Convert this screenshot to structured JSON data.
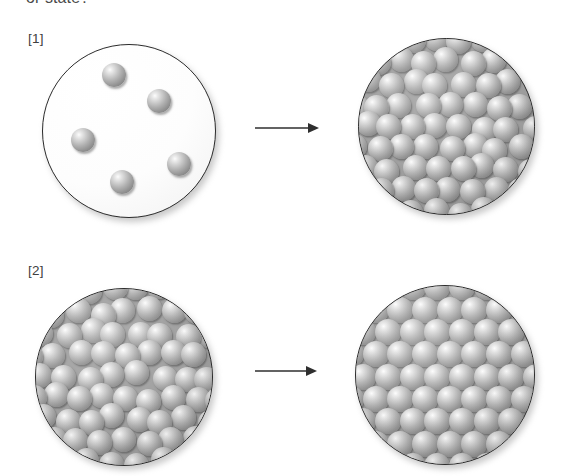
{
  "caption": {
    "top_text": "or state?"
  },
  "steps": [
    {
      "id": "1",
      "label": "[1]"
    },
    {
      "id": "2",
      "label": "[2]"
    }
  ],
  "icons": {
    "arrow": "right-arrow-icon"
  },
  "colors": {
    "sphere_base": "#949494",
    "sphere_highlight": "#fdfdfd",
    "sphere_shadow": "#6f6f6f",
    "outline": "#2b2b2b",
    "vessel_empty_fill": "#ffffff",
    "vessel_packed_fill": "#9e9e9e",
    "text": "#404040",
    "page_background": "#ffffff"
  },
  "diagram": {
    "type": "state-change-illustration",
    "rows": [
      {
        "step": "[1]",
        "before": {
          "name": "sparse-particles-vessel",
          "state": "gas",
          "arrangement": "scattered",
          "particle_count": 5,
          "vessel": {
            "x": 42,
            "y": 44,
            "size": 174
          },
          "particles": [
            {
              "x": 59,
              "y": 18,
              "r": 12
            },
            {
              "x": 104,
              "y": 44,
              "r": 12
            },
            {
              "x": 28,
              "y": 83,
              "r": 12
            },
            {
              "x": 124,
              "y": 107,
              "r": 12
            },
            {
              "x": 67,
              "y": 125,
              "r": 12
            }
          ]
        },
        "arrow": {
          "x": 255,
          "y": 121,
          "length": 62
        },
        "after": {
          "name": "dense-irregular-particles-vessel",
          "state": "liquid",
          "arrangement": "close-packed-irregular",
          "vessel": {
            "x": 358,
            "y": 38,
            "size": 177
          },
          "grid": {
            "rows": 8,
            "cols": 8,
            "radius": 12.5,
            "jitter": 3.4,
            "seed": 11
          }
        }
      },
      {
        "step": "[2]",
        "before": {
          "name": "dense-irregular-particles-vessel",
          "state": "liquid",
          "arrangement": "close-packed-irregular",
          "vessel": {
            "x": 35,
            "y": 288,
            "size": 178
          },
          "grid": {
            "rows": 8,
            "cols": 8,
            "radius": 12.5,
            "jitter": 3.6,
            "seed": 29
          }
        },
        "arrow": {
          "x": 255,
          "y": 364,
          "length": 60
        },
        "after": {
          "name": "ordered-lattice-particles-vessel",
          "state": "solid",
          "arrangement": "regular-lattice",
          "vessel": {
            "x": 355,
            "y": 285,
            "size": 180
          },
          "grid": {
            "rows": 8,
            "cols": 8,
            "radius": 13.0,
            "jitter": 0,
            "seed": 0
          }
        }
      }
    ]
  }
}
